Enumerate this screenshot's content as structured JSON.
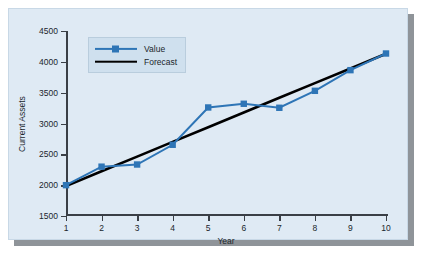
{
  "chart_data": {
    "type": "line",
    "title": "",
    "xlabel": "Year",
    "ylabel": "Current Assets",
    "x": [
      1,
      2,
      3,
      4,
      5,
      6,
      7,
      8,
      9,
      10
    ],
    "xtick_labels": [
      "1",
      "2",
      "3",
      "4",
      "5",
      "6",
      "7",
      "8",
      "9",
      "10"
    ],
    "ytick_labels": [
      "1500",
      "2000",
      "2500",
      "3000",
      "3500",
      "4000",
      "4500"
    ],
    "yticks": [
      1500,
      2000,
      2500,
      3000,
      3500,
      4000,
      4500
    ],
    "xlim": [
      1,
      10
    ],
    "ylim": [
      1500,
      4500
    ],
    "grid": false,
    "legend_position": "top-left",
    "series": [
      {
        "name": "Value",
        "color": "#2e75b6",
        "marker": "square",
        "values": [
          2000,
          2300,
          2335,
          2655,
          3260,
          3320,
          3255,
          3530,
          3865,
          4135
        ]
      },
      {
        "name": "Forecast",
        "color": "#000000",
        "marker": "none",
        "values": [
          1985,
          2225,
          2463,
          2702,
          2940,
          3178,
          3417,
          3655,
          3893,
          4130
        ]
      }
    ]
  },
  "legend": {
    "items": [
      {
        "label": "Value"
      },
      {
        "label": "Forecast"
      }
    ]
  },
  "colors": {
    "panel_background": "#dfeaf4",
    "series_value": "#2e75b6",
    "series_forecast": "#000000",
    "axis": "#3a3f46",
    "shadow": "#8f9499"
  }
}
